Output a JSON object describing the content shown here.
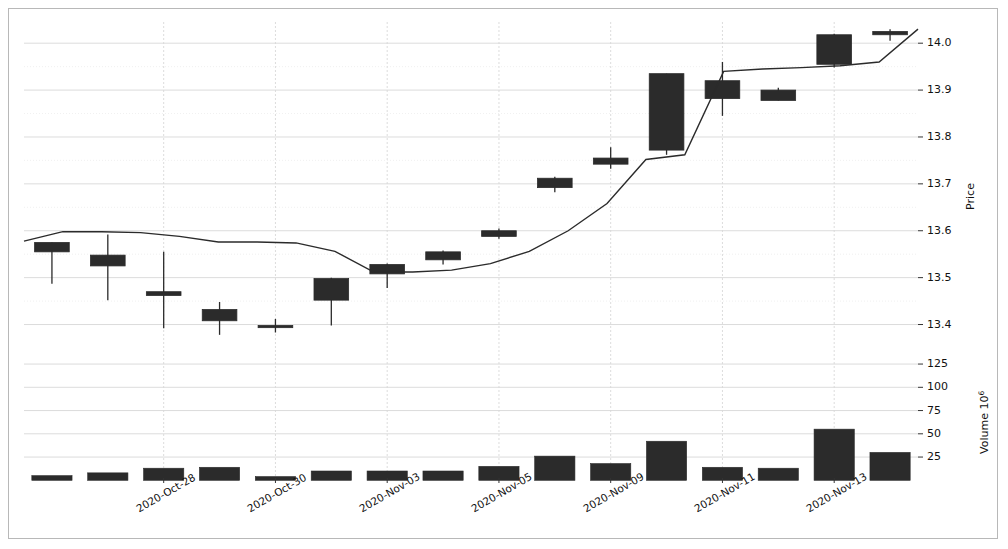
{
  "chart_data": {
    "type": "candlestick",
    "title": "",
    "xlabel": "",
    "ylabel": "Price",
    "volume_label": "Volume",
    "volume_exponent": "10",
    "volume_exponent_sup": "6",
    "price_ylim": [
      13.33,
      14.06
    ],
    "volume_ylim": [
      0,
      135
    ],
    "price_ticks": [
      "14.0",
      "13.9",
      "13.8",
      "13.7",
      "13.6",
      "13.5",
      "13.4"
    ],
    "price_tick_values": [
      14.0,
      13.9,
      13.8,
      13.7,
      13.6,
      13.5,
      13.4
    ],
    "volume_ticks": [
      "125",
      "100",
      "75",
      "50",
      "25"
    ],
    "volume_tick_values": [
      125,
      100,
      75,
      50,
      25
    ],
    "xtick_labels": [
      "2020-Oct-28",
      "2020-Oct-30",
      "2020-Nov-03",
      "2020-Nov-05",
      "2020-Nov-09",
      "2020-Nov-11",
      "2020-Nov-13"
    ],
    "xtick_indices": [
      2,
      4,
      6,
      8,
      10,
      12,
      14
    ],
    "grid": true,
    "legend": "none",
    "series_color": "#2b2b2b",
    "grid_color": "#d8d8d8",
    "candles": [
      {
        "date": "2020-Oct-26",
        "open": 13.555,
        "high": 13.575,
        "low": 13.487,
        "close": 13.575,
        "volume": 5,
        "direction": "up"
      },
      {
        "date": "2020-Oct-27",
        "open": 13.525,
        "high": 13.592,
        "low": 13.452,
        "close": 13.548,
        "volume": 8,
        "direction": "down"
      },
      {
        "date": "2020-Oct-28",
        "open": 13.47,
        "high": 13.555,
        "low": 13.392,
        "close": 13.462,
        "volume": 13,
        "direction": "down"
      },
      {
        "date": "2020-Oct-29",
        "open": 13.432,
        "high": 13.448,
        "low": 13.378,
        "close": 13.408,
        "volume": 14,
        "direction": "down"
      },
      {
        "date": "2020-Oct-30",
        "open": 13.398,
        "high": 13.412,
        "low": 13.383,
        "close": 13.398,
        "volume": 4,
        "direction": "down"
      },
      {
        "date": "2020-Nov-02",
        "open": 13.452,
        "high": 13.5,
        "low": 13.398,
        "close": 13.498,
        "volume": 10,
        "direction": "up"
      },
      {
        "date": "2020-Nov-03",
        "open": 13.508,
        "high": 13.53,
        "low": 13.478,
        "close": 13.528,
        "volume": 10,
        "direction": "up"
      },
      {
        "date": "2020-Nov-04",
        "open": 13.538,
        "high": 13.558,
        "low": 13.528,
        "close": 13.555,
        "volume": 10,
        "direction": "up"
      },
      {
        "date": "2020-Nov-05",
        "open": 13.588,
        "high": 13.605,
        "low": 13.583,
        "close": 13.6,
        "volume": 15,
        "direction": "up"
      },
      {
        "date": "2020-Nov-06",
        "open": 13.692,
        "high": 13.715,
        "low": 13.682,
        "close": 13.712,
        "volume": 26,
        "direction": "up"
      },
      {
        "date": "2020-Nov-09",
        "open": 13.742,
        "high": 13.778,
        "low": 13.732,
        "close": 13.755,
        "volume": 18,
        "direction": "up"
      },
      {
        "date": "2020-Nov-10",
        "open": 13.772,
        "high": 13.935,
        "low": 13.762,
        "close": 13.935,
        "volume": 42,
        "direction": "up"
      },
      {
        "date": "2020-Nov-11",
        "open": 13.882,
        "high": 13.96,
        "low": 13.845,
        "close": 13.92,
        "volume": 14,
        "direction": "down"
      },
      {
        "date": "2020-Nov-12",
        "open": 13.878,
        "high": 13.905,
        "low": 13.878,
        "close": 13.9,
        "volume": 13,
        "direction": "down"
      },
      {
        "date": "2020-Nov-13",
        "open": 13.955,
        "high": 14.02,
        "low": 13.948,
        "close": 14.018,
        "volume": 55,
        "direction": "up"
      },
      {
        "date": "2020-Nov-16",
        "open": 14.018,
        "high": 14.03,
        "low": 14.005,
        "close": 14.025,
        "volume": 30,
        "direction": "up"
      }
    ],
    "moving_average": {
      "name": "moving-average",
      "values": [
        13.578,
        13.598,
        13.598,
        13.596,
        13.588,
        13.576,
        13.576,
        13.574,
        13.556,
        13.512,
        13.512,
        13.516,
        13.53,
        13.556,
        13.6,
        13.658,
        13.752,
        13.762,
        13.94,
        13.945,
        13.948,
        13.952,
        13.96,
        14.03
      ]
    }
  }
}
